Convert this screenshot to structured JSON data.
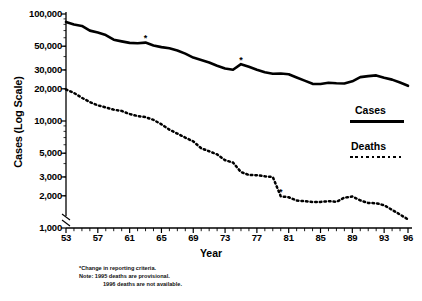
{
  "chart_data": {
    "type": "line",
    "title": "",
    "xlabel": "Year",
    "ylabel": "Cases (Log Scale)",
    "yscale": "log",
    "ylim": [
      1000,
      100000
    ],
    "xlim": [
      53,
      96
    ],
    "grid": false,
    "legend_position": "right",
    "ytick_labels": [
      "100,000",
      "50,000",
      "30,000",
      "20,000",
      "10,000",
      "5,000",
      "3,000",
      "2,000",
      "1,000"
    ],
    "ytick_values": [
      100000,
      50000,
      30000,
      20000,
      10000,
      5000,
      3000,
      2000,
      1000
    ],
    "xtick_labels": [
      "53",
      "57",
      "61",
      "65",
      "69",
      "73",
      "77",
      "81",
      "85",
      "89",
      "93",
      "96"
    ],
    "xtick_values": [
      53,
      57,
      61,
      65,
      69,
      73,
      77,
      81,
      85,
      89,
      93,
      96
    ],
    "axis_break": true,
    "x": [
      53,
      54,
      55,
      56,
      57,
      58,
      59,
      60,
      61,
      62,
      63,
      64,
      65,
      66,
      67,
      68,
      69,
      70,
      71,
      72,
      73,
      74,
      75,
      76,
      77,
      78,
      79,
      80,
      81,
      82,
      83,
      84,
      85,
      86,
      87,
      88,
      89,
      90,
      91,
      92,
      93,
      94,
      95,
      96
    ],
    "series": [
      {
        "name": "Cases",
        "style": "solid",
        "values": [
          84304,
          79775,
          77368,
          69895,
          67149,
          63534,
          57535,
          55494,
          53726,
          53315,
          54042,
          50874,
          49016,
          47767,
          45647,
          42623,
          39120,
          37137,
          35217,
          32882,
          30998,
          30122,
          33989,
          32105,
          30145,
          28521,
          27669,
          27749,
          27373,
          25520,
          23846,
          22255,
          22201,
          22768,
          22517,
          22436,
          23495,
          25701,
          26283,
          26673,
          25313,
          24361,
          22860,
          21337
        ]
      },
      {
        "name": "Deaths",
        "style": "dotted",
        "values": [
          19707,
          18303,
          16474,
          15016,
          14000,
          13390,
          12770,
          12417,
          11619,
          11134,
          10866,
          10243,
          9311,
          8303,
          7625,
          6992,
          6446,
          5560,
          5217,
          4876,
          4300,
          4089,
          3333,
          3130,
          3117,
          3040,
          2992,
          1978,
          1937,
          1807,
          1779,
          1752,
          1752,
          1782,
          1755,
          1921,
          1970,
          1810,
          1713,
          1705,
          1631,
          1478,
          1336,
          1202
        ]
      }
    ],
    "annotations": [
      {
        "label": "*",
        "series": "Cases",
        "x": 63
      },
      {
        "label": "*",
        "series": "Cases",
        "x": 75
      },
      {
        "label": "*",
        "series": "Deaths",
        "x": 80
      }
    ]
  },
  "legend": {
    "cases_label": "Cases",
    "deaths_label": "Deaths"
  },
  "footnotes": [
    "*Change in reporting criteria.",
    "Note:  1995 deaths are provisional.",
    "1996 deaths are not available."
  ]
}
